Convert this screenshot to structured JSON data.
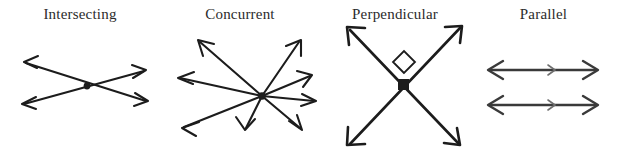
{
  "page": {
    "background_color": "#ffffff",
    "ink_color": "#1c1c1c",
    "label_color": "#2b2b2b",
    "width": 617,
    "height": 157
  },
  "figures": [
    {
      "id": "intersecting",
      "label": "Intersecting",
      "description": "Two straight lines crossing at a single marked point, each line with arrowheads on both ends",
      "line_count": 2,
      "intersection_points": 1,
      "marker": "dot"
    },
    {
      "id": "concurrent",
      "label": "Concurrent",
      "description": "Four straight lines (eight rays) all passing through one common marked point",
      "line_count": 4,
      "intersection_points": 1,
      "marker": "dot"
    },
    {
      "id": "perpendicular",
      "label": "Perpendicular",
      "description": "Two lines crossing at right angles, marked with a small square right-angle symbol",
      "line_count": 2,
      "intersection_points": 1,
      "marker": "right-angle-square",
      "angle": "90"
    },
    {
      "id": "parallel",
      "label": "Parallel",
      "description": "Two horizontal double-headed arrow lines that never meet, each carrying a single mid-line direction tick",
      "line_count": 2,
      "intersection_points": 0,
      "marker": "parallel-tick"
    }
  ]
}
